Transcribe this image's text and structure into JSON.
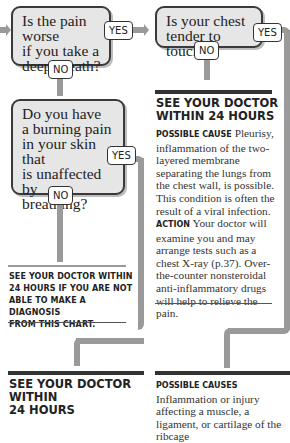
{
  "flowchart": {
    "question_1": {
      "text": "Is the pain worse if you take a deep breath?",
      "lines": [
        "Is the pain worse",
        "if you take a",
        "deep breath?"
      ],
      "yes_label": "YES",
      "no_label": "NO"
    },
    "question_2": {
      "text": "Is your chest tender to touch?",
      "lines": [
        "Is your chest",
        "tender to touch?"
      ],
      "yes_label": "YES",
      "no_label": "NO"
    },
    "question_3": {
      "text": "Do you have a burning pain in your skin that is unaffected by breathing?",
      "lines": [
        "Do you have",
        "a burning pain",
        "in your skin that",
        "is unaffected by",
        "breathing?"
      ],
      "yes_label": "YES",
      "no_label": "NO"
    },
    "outcome_pleurisy": {
      "heading_lines": [
        "SEE YOUR DOCTOR",
        "WITHIN 24 HOURS"
      ],
      "possible_cause_label": "Possible cause",
      "possible_cause_text": "Pleurisy, inflammation of the two-layered membrane separating the lungs from the chest wall, is possible. This condition is often the result of a viral infection.",
      "action_label": "Action",
      "action_text": "Your doctor will examine you and may arrange tests such as a chest X-ray (p.37). Over-the-counter nonsteroidal anti-inflammatory drugs will help to relieve the pain."
    },
    "outcome_no_diagnosis": {
      "lines": [
        "See your doctor within",
        "24 hours if you are not",
        "able to make a diagnosis",
        "from this chart."
      ]
    },
    "outcome_bottom_left": {
      "heading_lines": [
        "SEE YOUR DOCTOR WITHIN",
        "24 HOURS"
      ]
    },
    "outcome_bottom_right": {
      "possible_causes_label": "Possible causes",
      "possible_causes_text": "Inflammation or injury affecting a muscle, a ligament, or cartilage of the ribcage"
    }
  },
  "colors": {
    "box_fill": "#e6e6e6",
    "box_border": "#3a3a3a",
    "connector": "#9a9a9a",
    "rule": "#333333"
  }
}
